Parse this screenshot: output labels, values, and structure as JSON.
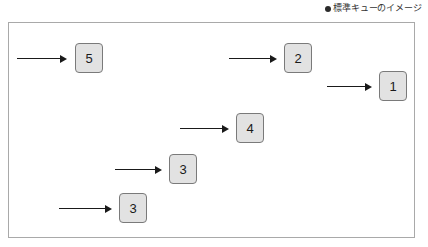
{
  "caption": {
    "marker_icon": "bullet-icon",
    "text": "標準キューのイメージ"
  },
  "diagram": {
    "type": "standard-queue-illustration",
    "frame": {
      "border_color": "#a9a9a9",
      "background": "#ffffff"
    },
    "box_style": {
      "fill": "#e2e2e2",
      "border_color": "#7a7a7a",
      "text_color": "#1a1a1a"
    },
    "arrow_color": "#1a1a1a",
    "messages": [
      {
        "label": "5",
        "box_left": 66,
        "box_top": 20,
        "arrow_left": 8,
        "arrow_top": 31,
        "arrow_width": 50
      },
      {
        "label": "2",
        "box_left": 275,
        "box_top": 20,
        "arrow_left": 220,
        "arrow_top": 31,
        "arrow_width": 48
      },
      {
        "label": "1",
        "box_left": 370,
        "box_top": 48,
        "arrow_left": 318,
        "arrow_top": 59,
        "arrow_width": 45
      },
      {
        "label": "4",
        "box_left": 227,
        "box_top": 90,
        "arrow_left": 171,
        "arrow_top": 101,
        "arrow_width": 49
      },
      {
        "label": "3",
        "box_left": 160,
        "box_top": 131,
        "arrow_left": 106,
        "arrow_top": 142,
        "arrow_width": 47
      },
      {
        "label": "3",
        "box_left": 110,
        "box_top": 170,
        "arrow_left": 50,
        "arrow_top": 181,
        "arrow_width": 53
      }
    ]
  }
}
